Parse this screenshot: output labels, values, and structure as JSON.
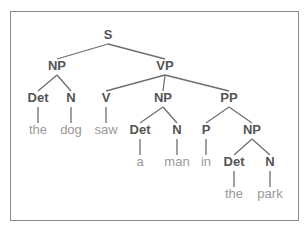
{
  "diagram": {
    "type": "parse-tree",
    "sentence": "the dog saw a man in the park",
    "colors": {
      "frame": "#8a8a8a",
      "edge": "#6e6e6e",
      "category": "#555555",
      "word": "#999999"
    },
    "nodes": [
      {
        "id": "S",
        "label": "S",
        "kind": "cat",
        "x": 108,
        "y": 36
      },
      {
        "id": "NP1",
        "label": "NP",
        "kind": "cat",
        "x": 57,
        "y": 67
      },
      {
        "id": "VP",
        "label": "VP",
        "kind": "cat",
        "x": 165,
        "y": 67
      },
      {
        "id": "Det1",
        "label": "Det",
        "kind": "cat",
        "x": 38,
        "y": 99
      },
      {
        "id": "N1",
        "label": "N",
        "kind": "cat",
        "x": 71,
        "y": 99
      },
      {
        "id": "V",
        "label": "V",
        "kind": "cat",
        "x": 106,
        "y": 99
      },
      {
        "id": "NP2",
        "label": "NP",
        "kind": "cat",
        "x": 163,
        "y": 99
      },
      {
        "id": "PP",
        "label": "PP",
        "kind": "cat",
        "x": 229,
        "y": 99
      },
      {
        "id": "w_the1",
        "label": "the",
        "kind": "word",
        "x": 38,
        "y": 131
      },
      {
        "id": "w_dog",
        "label": "dog",
        "kind": "word",
        "x": 71,
        "y": 131
      },
      {
        "id": "w_saw",
        "label": "saw",
        "kind": "word",
        "x": 106,
        "y": 131
      },
      {
        "id": "Det2",
        "label": "Det",
        "kind": "cat",
        "x": 140,
        "y": 131
      },
      {
        "id": "N2",
        "label": "N",
        "kind": "cat",
        "x": 177,
        "y": 131
      },
      {
        "id": "P",
        "label": "P",
        "kind": "cat",
        "x": 206,
        "y": 131
      },
      {
        "id": "NP3",
        "label": "NP",
        "kind": "cat",
        "x": 252,
        "y": 131
      },
      {
        "id": "w_a",
        "label": "a",
        "kind": "word",
        "x": 140,
        "y": 163
      },
      {
        "id": "w_man",
        "label": "man",
        "kind": "word",
        "x": 177,
        "y": 163
      },
      {
        "id": "w_in",
        "label": "in",
        "kind": "word",
        "x": 206,
        "y": 163
      },
      {
        "id": "Det3",
        "label": "Det",
        "kind": "cat",
        "x": 234,
        "y": 163
      },
      {
        "id": "N3",
        "label": "N",
        "kind": "cat",
        "x": 270,
        "y": 163
      },
      {
        "id": "w_the2",
        "label": "the",
        "kind": "word",
        "x": 234,
        "y": 195
      },
      {
        "id": "w_park",
        "label": "park",
        "kind": "word",
        "x": 270,
        "y": 195
      }
    ],
    "edges": [
      [
        "S",
        "NP1"
      ],
      [
        "S",
        "VP"
      ],
      [
        "NP1",
        "Det1"
      ],
      [
        "NP1",
        "N1"
      ],
      [
        "VP",
        "V"
      ],
      [
        "VP",
        "NP2"
      ],
      [
        "VP",
        "PP"
      ],
      [
        "Det1",
        "w_the1"
      ],
      [
        "N1",
        "w_dog"
      ],
      [
        "V",
        "w_saw"
      ],
      [
        "NP2",
        "Det2"
      ],
      [
        "NP2",
        "N2"
      ],
      [
        "PP",
        "P"
      ],
      [
        "PP",
        "NP3"
      ],
      [
        "Det2",
        "w_a"
      ],
      [
        "N2",
        "w_man"
      ],
      [
        "P",
        "w_in"
      ],
      [
        "NP3",
        "Det3"
      ],
      [
        "NP3",
        "N3"
      ],
      [
        "Det3",
        "w_the2"
      ],
      [
        "N3",
        "w_park"
      ]
    ]
  }
}
